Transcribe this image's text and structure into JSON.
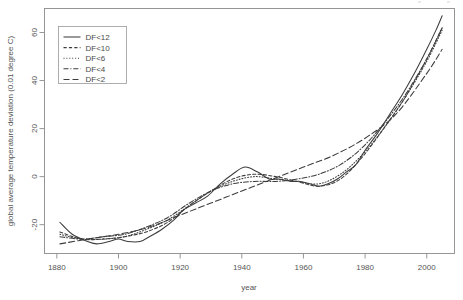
{
  "chart_data": {
    "type": "line",
    "title": "",
    "xlabel": "year",
    "ylabel": "global average temperature deviation (0.01 degree C)",
    "xlim": [
      1876,
      2009
    ],
    "ylim": [
      -32,
      70
    ],
    "xticks": [
      1880,
      1900,
      1920,
      1940,
      1960,
      1980,
      2000
    ],
    "xtick_labels": [
      "1880",
      "1900",
      "1920",
      "1940",
      "1960",
      "1980",
      "2000"
    ],
    "yticks": [
      -20,
      0,
      20,
      40,
      60
    ],
    "ytick_labels": [
      "-20",
      "0",
      "20",
      "40",
      "60"
    ],
    "grid": false,
    "legend_position": "top-left",
    "legend_title": "",
    "series": [
      {
        "name": "DF<12",
        "dash": "solid",
        "x": [
          1881,
          1885,
          1890,
          1893,
          1897,
          1900,
          1903,
          1907,
          1910,
          1914,
          1918,
          1921,
          1925,
          1929,
          1933,
          1937,
          1941,
          1945,
          1949,
          1952,
          1956,
          1959,
          1962,
          1965,
          1968,
          1971,
          1974,
          1977,
          1980,
          1984,
          1988,
          1992,
          1996,
          2000,
          2003,
          2005
        ],
        "y": [
          -19,
          -24,
          -27,
          -28,
          -27,
          -26,
          -27,
          -27,
          -25,
          -22,
          -18,
          -14,
          -11,
          -8,
          -3,
          1,
          4,
          2,
          -1,
          -1,
          -2,
          -2,
          -3,
          -4,
          -3,
          -1,
          2,
          5,
          11,
          18,
          26,
          34,
          43,
          53,
          61,
          67
        ]
      },
      {
        "name": "DF<10",
        "dash": "dotted",
        "x": [
          1881,
          1888,
          1895,
          1902,
          1909,
          1916,
          1923,
          1930,
          1937,
          1944,
          1951,
          1958,
          1965,
          1972,
          1979,
          1986,
          1993,
          2000,
          2005
        ],
        "y": [
          -23,
          -26,
          -26,
          -25,
          -23,
          -19,
          -12,
          -6,
          -1,
          1,
          0,
          -2,
          -4,
          -1,
          8,
          20,
          33,
          49,
          62
        ]
      },
      {
        "name": "DF<6",
        "dash": "fine-dotted",
        "x": [
          1881,
          1888,
          1895,
          1902,
          1909,
          1916,
          1923,
          1930,
          1937,
          1944,
          1951,
          1958,
          1965,
          1972,
          1979,
          1986,
          1993,
          2000,
          2005
        ],
        "y": [
          -24,
          -26,
          -26,
          -25,
          -22,
          -18,
          -12,
          -6,
          -2,
          0,
          -1,
          -2,
          -3,
          1,
          9,
          20,
          33,
          48,
          61
        ]
      },
      {
        "name": "DF<4",
        "dash": "dash-dot",
        "x": [
          1881,
          1888,
          1895,
          1902,
          1909,
          1916,
          1923,
          1930,
          1937,
          1944,
          1951,
          1958,
          1965,
          1972,
          1979,
          1986,
          1993,
          2000,
          2005
        ],
        "y": [
          -25,
          -26,
          -25,
          -24,
          -21,
          -17,
          -11,
          -6,
          -3,
          -2,
          -2,
          -1,
          1,
          5,
          12,
          22,
          34,
          49,
          62
        ]
      },
      {
        "name": "DF<2",
        "dash": "long-dash",
        "x": [
          1881,
          1890,
          1900,
          1910,
          1920,
          1930,
          1940,
          1950,
          1960,
          1970,
          1980,
          1990,
          2000,
          2005
        ],
        "y": [
          -28,
          -26,
          -24,
          -21,
          -16,
          -11,
          -6,
          -1,
          4,
          9,
          16,
          26,
          43,
          53
        ]
      }
    ],
    "legend_entries": [
      "DF<12",
      "DF<10",
      "DF<6",
      "DF<4",
      "DF<2"
    ],
    "line_color": "#3c3c3c"
  }
}
